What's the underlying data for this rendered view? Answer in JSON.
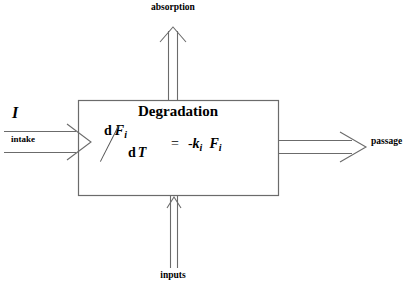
{
  "diagram": {
    "colors": {
      "stroke": "#5a5a5a",
      "box_stroke": "#6b6b6b",
      "text": "#000000",
      "background": "#ffffff"
    },
    "box": {
      "label": "Degradation",
      "equation": {
        "numerator_d": "d",
        "numerator_var": "F",
        "numerator_sub": "i",
        "denominator_d": "d",
        "denominator_var": "T",
        "equals": "=",
        "minus": "-",
        "rate_var": "k",
        "rate_sub": "i",
        "state_var": "F",
        "state_sub": "i",
        "plain_text": "d Fi / dT = - ki Fi"
      }
    },
    "flows": [
      {
        "name": "intake-flow",
        "label": "intake",
        "symbol": "I",
        "direction": "right",
        "arrow_style": "double-line-open-head"
      },
      {
        "name": "absorption-flow",
        "label": "absorption",
        "direction": "up",
        "arrow_style": "double-line-open-head"
      },
      {
        "name": "inputs-flow",
        "label": "inputs",
        "direction": "up",
        "arrow_style": "double-line-open-head"
      },
      {
        "name": "passage-flow",
        "label": "passage",
        "direction": "right",
        "arrow_style": "double-line-open-head"
      }
    ]
  }
}
